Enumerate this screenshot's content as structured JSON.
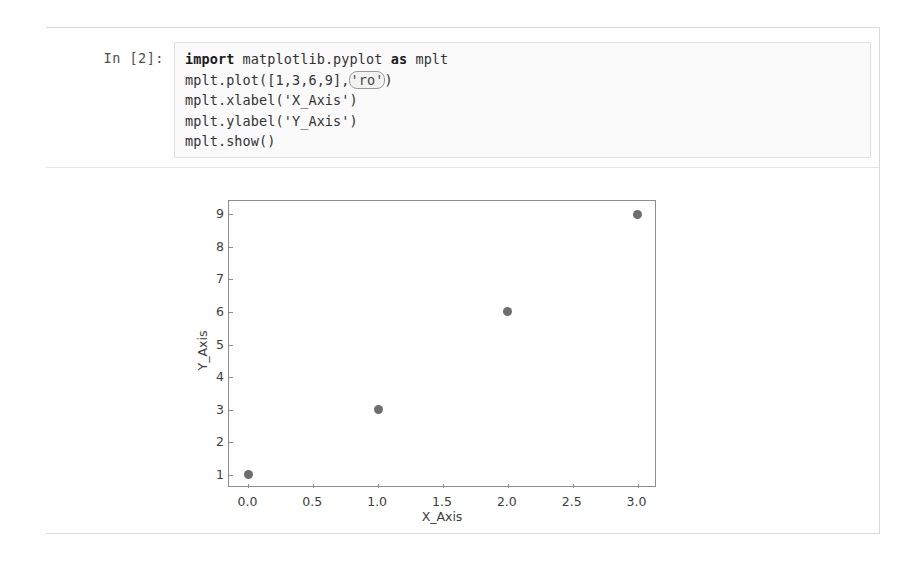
{
  "notebook": {
    "cell": {
      "prompt_label": "In [2]:",
      "code_lines": [
        {
          "segments": [
            {
              "text": "import",
              "type": "keyword"
            },
            {
              "text": " matplotlib.pyplot ",
              "type": "plain"
            },
            {
              "text": "as",
              "type": "keyword"
            },
            {
              "text": " mplt",
              "type": "plain"
            }
          ]
        },
        {
          "segments": [
            {
              "text": "mplt.plot([1,3,6,9],",
              "type": "plain"
            },
            {
              "text": "'ro'",
              "type": "string-highlighted"
            },
            {
              "text": ")",
              "type": "plain"
            }
          ]
        },
        {
          "segments": [
            {
              "text": "mplt.xlabel('X_Axis')",
              "type": "plain"
            }
          ]
        },
        {
          "segments": [
            {
              "text": "mplt.ylabel('Y_Axis')",
              "type": "plain"
            }
          ]
        },
        {
          "segments": [
            {
              "text": "mplt.show()",
              "type": "plain"
            }
          ]
        }
      ],
      "code_plain": [
        "import matplotlib.pyplot as mplt",
        "mplt.plot([1,3,6,9],'ro')",
        "mplt.xlabel('X_Axis')",
        "mplt.ylabel('Y_Axis')",
        "mplt.show()"
      ]
    }
  },
  "chart_data": {
    "type": "scatter",
    "title": "",
    "xlabel": "X_Axis",
    "ylabel": "Y_Axis",
    "x": [
      0,
      1,
      2,
      3
    ],
    "y": [
      1,
      3,
      6,
      9
    ],
    "series": [
      {
        "name": "ro",
        "marker": "o",
        "color": "#6e6e6e",
        "x": [
          0,
          1,
          2,
          3
        ],
        "y": [
          1,
          3,
          6,
          9
        ]
      }
    ],
    "xticks": [
      "0.0",
      "0.5",
      "1.0",
      "1.5",
      "2.0",
      "2.5",
      "3.0"
    ],
    "xtick_values": [
      0.0,
      0.5,
      1.0,
      1.5,
      2.0,
      2.5,
      3.0
    ],
    "yticks": [
      "1",
      "2",
      "3",
      "4",
      "5",
      "6",
      "7",
      "8",
      "9"
    ],
    "ytick_values": [
      1,
      2,
      3,
      4,
      5,
      6,
      7,
      8,
      9
    ],
    "xlim": [
      -0.15,
      3.15
    ],
    "ylim": [
      0.6,
      9.4
    ],
    "grid": false,
    "legend": null
  },
  "colors": {
    "marker": "#6e6e6e",
    "axes_line": "#8d8d8d",
    "cell_background": "#fafafa",
    "frame_border": "#d9d9d9",
    "gutter_bar": "#bdbdbd"
  }
}
